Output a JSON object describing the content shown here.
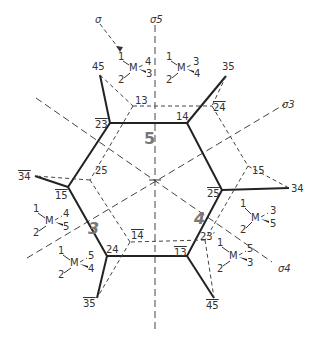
{
  "axes": {
    "sigma5": "σ5",
    "sigma3": "σ3",
    "sigma4": "σ4",
    "arrow_label": "σ"
  },
  "hexagon_vertices": {
    "v23bar": "23",
    "v14": "14",
    "v25bar": "25",
    "v13bar": "13",
    "v24": "24",
    "v15bar": "15"
  },
  "outer_labels": {
    "o45": "45",
    "o35": "35",
    "o34": "34",
    "o45bar": "45",
    "o35bar": "35",
    "o34bar": "34"
  },
  "inner_labels": {
    "i13": "13",
    "i24bar": "24",
    "i15": "15",
    "i23p": "23′",
    "i14bar": "14",
    "i25": "25"
  },
  "regions": {
    "r5": "5",
    "r3": "3",
    "r4": "4"
  },
  "molecules": [
    {
      "center": "M",
      "l1": "1",
      "l2": "2",
      "ldash": "4",
      "lwedge": "3"
    },
    {
      "center": "M",
      "l1": "1",
      "l2": "2",
      "ldash": "3",
      "lwedge": "4"
    },
    {
      "center": "M",
      "l1": "1",
      "l2": "2",
      "ldash": "4",
      "lwedge": "5"
    },
    {
      "center": "M",
      "l1": "1",
      "l2": "2",
      "ldash": "5",
      "lwedge": "4"
    },
    {
      "center": "M",
      "l1": "1",
      "l2": "2",
      "ldash": "3",
      "lwedge": "5"
    },
    {
      "center": "M",
      "l1": "1",
      "l2": "2",
      "ldash": "5",
      "lwedge": "3"
    }
  ]
}
